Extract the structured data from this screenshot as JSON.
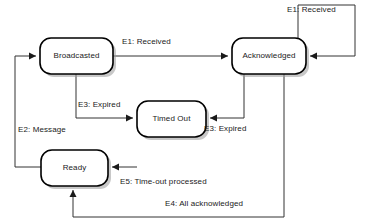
{
  "diagram": {
    "type": "state-machine",
    "title": "",
    "canvas": {
      "width": 371,
      "height": 224,
      "background": "#ffffff"
    },
    "colors": {
      "state_fill": "#ffffff",
      "state_stroke": "#000000",
      "edge_stroke": "#333333",
      "text": "#1a1a1a",
      "shadow": "#9a9a9a"
    },
    "states": [
      {
        "id": "broadcasted",
        "label": "Broadcasted",
        "x": 40,
        "y": 38,
        "w": 73,
        "h": 36
      },
      {
        "id": "acknowledged",
        "label": "Acknowledged",
        "x": 232,
        "y": 38,
        "w": 74,
        "h": 36
      },
      {
        "id": "timed_out",
        "label": "Timed Out",
        "x": 137,
        "y": 101,
        "w": 69,
        "h": 36
      },
      {
        "id": "ready",
        "label": "Ready",
        "x": 41,
        "y": 150,
        "w": 67,
        "h": 36
      }
    ],
    "transitions": [
      {
        "id": "t1",
        "label": "E1: Received",
        "from": "broadcasted",
        "to": "acknowledged",
        "label_x": 122,
        "label_y": 37
      },
      {
        "id": "t2",
        "label": "E1: Received",
        "from": "acknowledged",
        "to": "acknowledged",
        "label_x": 287,
        "label_y": 5
      },
      {
        "id": "t3",
        "label": "E3: Expired",
        "from": "broadcasted",
        "to": "timed_out",
        "label_x": 78,
        "label_y": 100
      },
      {
        "id": "t4",
        "label": "E3: Expired",
        "from": "acknowledged",
        "to": "timed_out",
        "label_x": 204,
        "label_y": 124
      },
      {
        "id": "t5",
        "label": "E2: Message",
        "from": "ready",
        "to": "broadcasted",
        "label_x": 18,
        "label_y": 125
      },
      {
        "id": "t6",
        "label": "E5: Time-out processed",
        "from": "timed_out",
        "to": "ready",
        "label_x": 120,
        "label_y": 177
      },
      {
        "id": "t7",
        "label": "E4: All acknowledged",
        "from": "acknowledged",
        "to": "ready",
        "label_x": 165,
        "label_y": 199
      }
    ]
  }
}
